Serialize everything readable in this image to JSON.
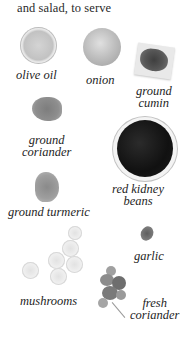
{
  "heading": "and salad, to serve",
  "ingredients": [
    {
      "name": "olive oil",
      "icon": "olive-oil-bowl"
    },
    {
      "name": "onion",
      "icon": "onion"
    },
    {
      "name_line1": "ground",
      "name_line2": "cumin",
      "icon": "ground-cumin"
    },
    {
      "name_line1": "ground",
      "name_line2": "coriander",
      "icon": "ground-coriander"
    },
    {
      "name_line1": "red kidney",
      "name_line2": "beans",
      "icon": "kidney-beans-bowl"
    },
    {
      "name": "ground turmeric",
      "icon": "ground-turmeric"
    },
    {
      "name": "garlic",
      "icon": "garlic-clove"
    },
    {
      "name": "mushrooms",
      "icon": "mushrooms"
    },
    {
      "name_line1": "fresh",
      "name_line2": "coriander",
      "icon": "fresh-coriander"
    }
  ]
}
